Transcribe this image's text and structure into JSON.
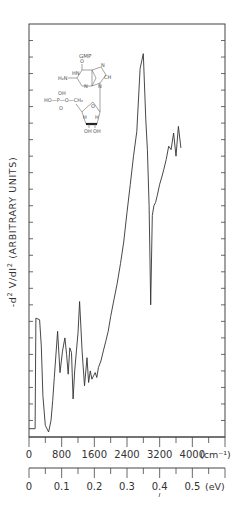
{
  "chart_data": {
    "type": "line",
    "title": "",
    "inset_label": "GMP",
    "ylabel": "-d² V/dI² (ARBITRARY UNITS)",
    "ylabel_parts": {
      "prefix": "-d",
      "sup1": "2",
      "mid": " V/dI",
      "sup2": "2",
      "suffix": " (ARBITRARY UNITS)"
    },
    "x_axes": [
      {
        "unit": "(cm⁻¹)",
        "tick_labels": [
          "0",
          "800",
          "1600",
          "2400",
          "3200",
          "4000"
        ],
        "range": [
          0,
          4800
        ],
        "minor_tick_step": 400
      },
      {
        "unit": "(eV)",
        "tick_labels": [
          "0",
          "0.1",
          "0.2",
          "0.3",
          "0.4",
          "0.5"
        ],
        "range": [
          0,
          0.6
        ],
        "minor_tick_step": 0.05
      }
    ],
    "yticks_count": 25,
    "ylim": [
      0,
      25
    ],
    "grid": false,
    "series": [
      {
        "name": "GMP tunneling spectrum",
        "x_cm": [
          0,
          150,
          170,
          260,
          300,
          340,
          400,
          480,
          540,
          580,
          620,
          700,
          760,
          820,
          880,
          920,
          960,
          1000,
          1040,
          1080,
          1120,
          1160,
          1200,
          1240,
          1300,
          1360,
          1420,
          1460,
          1500,
          1540,
          1580,
          1620,
          1660,
          1700,
          1760,
          1820,
          1880,
          1940,
          2000,
          2080,
          2160,
          2240,
          2320,
          2400,
          2480,
          2560,
          2640,
          2720,
          2800,
          2860,
          2900,
          2940,
          2980,
          3020,
          3060,
          3100,
          3140,
          3200,
          3260,
          3300,
          3360,
          3420,
          3480,
          3540,
          3600,
          3660,
          3720
        ],
        "y": [
          0.5,
          0.5,
          7.2,
          7.1,
          5.5,
          2.5,
          0.7,
          0.3,
          1.0,
          2.2,
          3.6,
          6.4,
          3.9,
          5.2,
          6.0,
          5.0,
          3.8,
          5.4,
          5.1,
          2.3,
          4.0,
          5.2,
          6.3,
          8.2,
          5.2,
          3.1,
          4.8,
          3.3,
          4.0,
          3.5,
          3.7,
          3.9,
          3.6,
          4.2,
          4.6,
          5.2,
          5.8,
          6.4,
          7.3,
          8.3,
          9.3,
          10.5,
          11.8,
          13.6,
          15.3,
          17.0,
          18.5,
          22.3,
          23.2,
          19.2,
          17.4,
          14.0,
          8.0,
          13.4,
          14.0,
          14.2,
          14.6,
          15.3,
          15.8,
          16.2,
          16.8,
          17.6,
          17.4,
          18.4,
          17.0,
          18.8,
          17.5
        ]
      }
    ],
    "annotations": [
      "GMP molecular structure inset (guanine base, phosphate HO-P-O-CH2, ribose with OH OH)"
    ]
  },
  "inset": {
    "title": "GMP",
    "atoms": {
      "o_top": "O",
      "hn": "HN",
      "n7": "N",
      "ch": "CH",
      "h2n": "H₂N",
      "c_ring": "C",
      "n3": "N",
      "n9": "N",
      "oh_p": "OH",
      "ho_p": "HO—P—O—CH₂",
      "o_p": "O",
      "o_ring": "O",
      "h": "H",
      "oh1": "OH",
      "oh2": "OH"
    }
  }
}
